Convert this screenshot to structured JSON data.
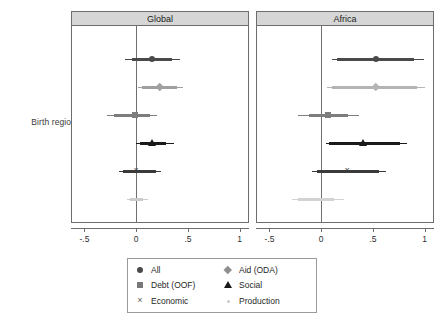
{
  "figure": {
    "ylabel": "Birth region",
    "panels": [
      {
        "title": "Global"
      },
      {
        "title": "Africa"
      }
    ]
  },
  "axis": {
    "ticks": [
      "-.5",
      "0",
      ".5",
      "1"
    ],
    "tick_values": [
      -0.5,
      0,
      0.5,
      1
    ],
    "xmin": -0.62,
    "xmax": 1.08
  },
  "legend": {
    "items": [
      {
        "label": "All",
        "marker": "circle-marker",
        "color": "#4a4a4a"
      },
      {
        "label": "Aid (ODA)",
        "marker": "diamond-marker",
        "color": "#8f8f8f"
      },
      {
        "label": "Debt (OOF)",
        "marker": "square-marker",
        "color": "#787878"
      },
      {
        "label": "Social",
        "marker": "triangle-marker",
        "color": "#1a1a1a"
      },
      {
        "label": "Economic",
        "marker": "cross-marker",
        "color": "#5a5a5a"
      },
      {
        "label": "Production",
        "marker": "small-dot-marker",
        "color": "#c9c9c9"
      }
    ]
  },
  "chart_data": {
    "type": "scatter",
    "title": "",
    "xlabel": "",
    "ylabel": "Birth region",
    "xlim": [
      -0.62,
      1.08
    ],
    "xticks": [
      -0.5,
      0,
      0.5,
      1
    ],
    "grid": false,
    "legend_position": "bottom",
    "reference_line": 0,
    "series_order": [
      "All",
      "Aid (ODA)",
      "Debt (OOF)",
      "Social",
      "Economic",
      "Production"
    ],
    "panels": [
      {
        "name": "Global",
        "estimates": [
          {
            "series": "All",
            "marker": "circle-marker",
            "color": "#4a4a4a",
            "coef": 0.15,
            "ci_low": -0.11,
            "ci_high": 0.42,
            "ci90_low": -0.04,
            "ci90_high": 0.35
          },
          {
            "series": "Aid (ODA)",
            "marker": "diamond-marker",
            "color": "#a0a0a0",
            "coef": 0.23,
            "ci_low": 0.02,
            "ci_high": 0.45,
            "ci90_low": 0.06,
            "ci90_high": 0.39
          },
          {
            "series": "Debt (OOF)",
            "marker": "square-marker",
            "color": "#7d7d7d",
            "coef": -0.01,
            "ci_low": -0.28,
            "ci_high": 0.2,
            "ci90_low": -0.21,
            "ci90_high": 0.13
          },
          {
            "series": "Social",
            "marker": "triangle-marker",
            "color": "#1a1a1a",
            "coef": 0.15,
            "ci_low": 0.0,
            "ci_high": 0.37,
            "ci90_low": 0.04,
            "ci90_high": 0.29
          },
          {
            "series": "Economic",
            "marker": "cross-marker",
            "color": "#3a3a3a",
            "coef": 0.0,
            "ci_low": -0.17,
            "ci_high": 0.24,
            "ci90_low": -0.13,
            "ci90_high": 0.19
          },
          {
            "series": "Production",
            "marker": "small-dot-marker",
            "color": "#cccccc",
            "coef": 0.0,
            "ci_low": -0.09,
            "ci_high": 0.11,
            "ci90_low": -0.06,
            "ci90_high": 0.07
          }
        ]
      },
      {
        "name": "Africa",
        "estimates": [
          {
            "series": "All",
            "marker": "circle-marker",
            "color": "#4a4a4a",
            "coef": 0.53,
            "ci_low": 0.1,
            "ci_high": 0.99,
            "ci90_low": 0.15,
            "ci90_high": 0.9
          },
          {
            "series": "Aid (ODA)",
            "marker": "diamond-marker",
            "color": "#b4b4b4",
            "coef": 0.53,
            "ci_low": 0.06,
            "ci_high": 1.0,
            "ci90_low": 0.1,
            "ci90_high": 0.93
          },
          {
            "series": "Debt (OOF)",
            "marker": "square-marker",
            "color": "#7d7d7d",
            "coef": 0.07,
            "ci_low": -0.22,
            "ci_high": 0.37,
            "ci90_low": -0.12,
            "ci90_high": 0.26
          },
          {
            "series": "Social",
            "marker": "triangle-marker",
            "color": "#1a1a1a",
            "coef": 0.4,
            "ci_low": 0.05,
            "ci_high": 0.83,
            "ci90_low": 0.08,
            "ci90_high": 0.76
          },
          {
            "series": "Economic",
            "marker": "cross-marker",
            "color": "#3a3a3a",
            "coef": 0.25,
            "ci_low": -0.09,
            "ci_high": 0.63,
            "ci90_low": -0.04,
            "ci90_high": 0.56
          },
          {
            "series": "Production",
            "marker": "small-dot-marker",
            "color": "#d2d2d2",
            "coef": 0.0,
            "ci_low": -0.28,
            "ci_high": 0.22,
            "ci90_low": -0.22,
            "ci90_high": 0.12
          }
        ]
      }
    ]
  }
}
